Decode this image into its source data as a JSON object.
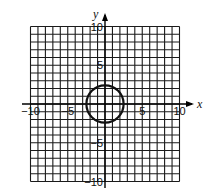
{
  "header": {
    "problem_marker": ""
  },
  "chart_data": {
    "type": "line",
    "title": "",
    "xlabel": "x",
    "ylabel": "y",
    "xlim": [
      -10,
      10
    ],
    "ylim": [
      -10,
      10
    ],
    "grid": true,
    "grid_step": 1,
    "x_ticks": [
      {
        "value": -10,
        "label": "-10"
      },
      {
        "value": -5,
        "label": "-5"
      },
      {
        "value": 5,
        "label": "5"
      },
      {
        "value": 10,
        "label": "10"
      }
    ],
    "y_ticks": [
      {
        "value": 10,
        "label": "10"
      },
      {
        "value": 5,
        "label": "5"
      },
      {
        "value": -5,
        "label": "-5"
      },
      {
        "value": -10,
        "label": "-10"
      }
    ],
    "series": [
      {
        "name": "circle",
        "shape": "circle",
        "center": [
          0,
          0
        ],
        "radius": 2.5
      }
    ]
  },
  "colors": {
    "grid": "#1a1a1a",
    "curve": "#111111",
    "background": "#ffffff"
  }
}
